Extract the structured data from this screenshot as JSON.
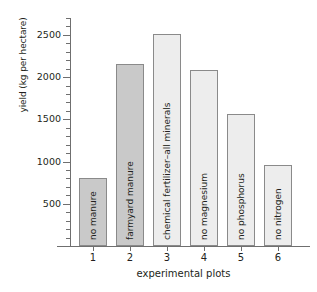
{
  "chart_data": {
    "type": "bar",
    "title": "",
    "xlabel": "experimental plots",
    "ylabel": "yield (kg per hectare)",
    "categories": [
      "1",
      "2",
      "3",
      "4",
      "5",
      "6"
    ],
    "values": [
      800,
      2160,
      2510,
      2080,
      1560,
      960
    ],
    "bar_labels": [
      "no manure",
      "farmyard manure",
      "chemical fertilizer–all minerals",
      "no magnesium",
      "no phosphorus",
      "no nitrogen"
    ],
    "bar_colors": [
      "#c9c9c9",
      "#c9c9c9",
      "#ededed",
      "#ededed",
      "#ededed",
      "#ededed"
    ],
    "bar_edge_color": "#8a8a8a",
    "axis_color": "#6f6f6f",
    "ylim": [
      0,
      2700
    ],
    "ytick_labels": [
      "500",
      "1000",
      "1500",
      "2000",
      "2500"
    ],
    "ytick_values": [
      500,
      1000,
      1500,
      2000,
      2500
    ],
    "yminor_step": 100,
    "grid": false,
    "legend": "none"
  }
}
